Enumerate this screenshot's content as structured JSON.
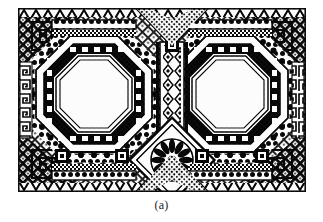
{
  "figure": {
    "caption": "(a)",
    "kind": "photograph-of-ornamental-panel",
    "medium": "black-and-white halftone scan",
    "plate": {
      "x": 18,
      "y": 8,
      "width": 288,
      "height": 184,
      "background_color": "#ffffff",
      "ink_color": "#101010",
      "mid_tone_color": "#4a4a4a"
    },
    "palette": {
      "ink": "#101010",
      "ink_soft": "#2e2e2e",
      "mid": "#5a5a5a",
      "paper": "#ffffff",
      "paper_warm": "#f7f7f5",
      "caption": "#1c1c1c"
    },
    "composition": {
      "symmetry": "bilateral, mirrored about the vertical centre line",
      "medallion_count": 2,
      "medallion_shape": "octagon",
      "medallions": [
        {
          "id": "left-octagon",
          "center_x": 90,
          "center_y": 86,
          "outer_radius": 66
        },
        {
          "id": "right-octagon",
          "center_x": 218,
          "center_y": 86,
          "outer_radius": 66
        }
      ],
      "center_rosette": {
        "center_x": 154,
        "center_y": 152,
        "petal_count": 12,
        "frame": "diamond"
      },
      "bands": [
        "outer chevron / zig-zag border",
        "dotted bead band",
        "stepped fret (meander) band",
        "crenellated black band",
        "plain white field"
      ],
      "corner_motif": "endless-knot fret (meander) square",
      "field_texture": "diagonal lattice with small squares"
    }
  }
}
